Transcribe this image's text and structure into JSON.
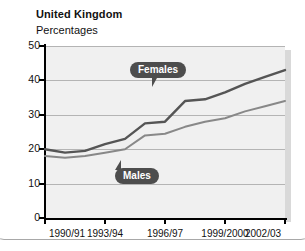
{
  "header": {
    "title": "United Kingdom",
    "subtitle": "Percentages"
  },
  "chart_data": {
    "type": "line",
    "title": "United Kingdom",
    "subtitle": "Percentages",
    "xlabel": "",
    "ylabel": "Percentages",
    "ylim": [
      0,
      50
    ],
    "yticks": [
      0,
      10,
      20,
      30,
      40,
      50
    ],
    "grid": true,
    "legend_position": "inline-callouts",
    "x": [
      "1990/91",
      "1991/92",
      "1992/93",
      "1993/94",
      "1994/95",
      "1995/96",
      "1996/97",
      "1997/98",
      "1998/99",
      "1999/2000",
      "2000/01",
      "2001/02",
      "2002/03"
    ],
    "xtick_labels": [
      "1990/91",
      "1993/94",
      "1996/97",
      "1999/2000",
      "2002/03"
    ],
    "xtick_indices": [
      0,
      3,
      6,
      9,
      12
    ],
    "series": [
      {
        "name": "Females",
        "color": "#555555",
        "values": [
          20,
          19,
          19.5,
          21.5,
          23,
          27.5,
          28,
          34,
          34.5,
          36.5,
          39,
          41,
          43
        ]
      },
      {
        "name": "Males",
        "color": "#888888",
        "values": [
          18,
          17.5,
          18,
          19,
          20,
          24,
          24.5,
          26.5,
          28,
          29,
          31,
          32.5,
          34
        ]
      }
    ]
  },
  "axis": {
    "y_tick_labels": [
      "50",
      "40",
      "30",
      "20",
      "10",
      "0"
    ],
    "x_tick_labels": [
      "1990/91",
      "1993/94",
      "1996/97",
      "1999/2000",
      "2002/03"
    ]
  },
  "callouts": {
    "females": "Females",
    "males": "Males"
  },
  "colors": {
    "plot_background": "#f0f0f0",
    "gridline": "#b4b4b4",
    "axis": "#000000",
    "females_line": "#555555",
    "males_line": "#888888",
    "callout_background": "#4d4d4d",
    "callout_text": "#ffffff"
  }
}
